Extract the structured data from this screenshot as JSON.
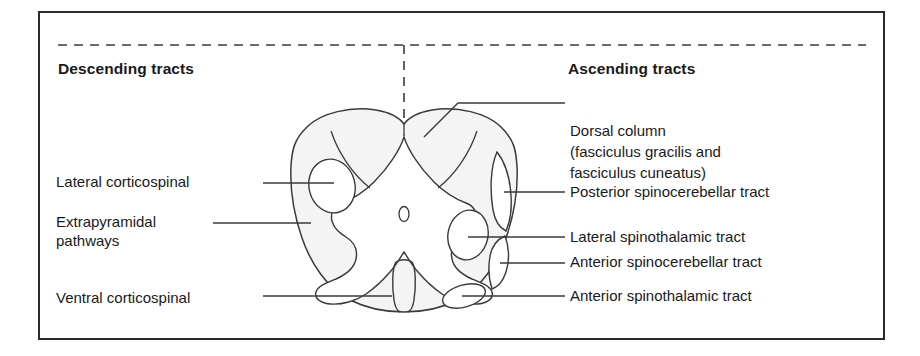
{
  "figure": {
    "title_descending": "Descending tracts",
    "title_ascending": "Ascending tracts",
    "border_color": "#2b2b2b",
    "stroke_color": "#3a3a3a",
    "white_matter_fill": "#f4f4f4",
    "gray_matter_fill": "#ffffff",
    "midline_style": "dashed"
  },
  "descending_labels": [
    {
      "id": "lateral-corticospinal",
      "text": "Lateral corticospinal"
    },
    {
      "id": "extrapyramidal-pathways",
      "line1": "Extrapyramidal",
      "line2": "pathways"
    },
    {
      "id": "ventral-corticospinal",
      "text": "Ventral corticospinal"
    }
  ],
  "ascending_labels": [
    {
      "id": "dorsal-column",
      "line1": "Dorsal column",
      "line2": "(fasciculus gracilis and",
      "line3": "fasciculus cuneatus)"
    },
    {
      "id": "posterior-spinocerebellar",
      "text": "Posterior spinocerebellar tract"
    },
    {
      "id": "lateral-spinothalamic",
      "text": "Lateral spinothalamic tract"
    },
    {
      "id": "anterior-spinocerebellar",
      "text": "Anterior spinocerebellar tract"
    },
    {
      "id": "anterior-spinothalamic",
      "text": "Anterior spinothalamic tract"
    }
  ],
  "anatomy": {
    "cord_outline": "spinal-cord-cross-section",
    "structures": [
      "central-canal",
      "gray-matter-butterfly",
      "anterior-median-fissure",
      "posterior-median-septum",
      "lateral-corticospinal-tract-oval",
      "lateral-spinothalamic-tract-oval",
      "anterior-spinothalamic-tract-oval",
      "posterior-spinocerebellar-tract-band",
      "anterior-spinocerebellar-tract-band"
    ]
  }
}
